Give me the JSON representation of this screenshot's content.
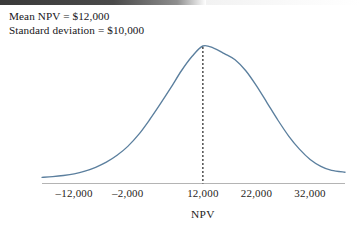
{
  "figure": {
    "background_color": "#ffffff",
    "top_bar_color": "#3a3a3a"
  },
  "annotations": {
    "line1": "Mean NPV = $12,000",
    "line2": "Standard deviation = $10,000"
  },
  "chart_data": {
    "type": "line",
    "title": "",
    "subtitle": "",
    "xlabel": "NPV",
    "ylabel": "",
    "grid": false,
    "legend": null,
    "curve_color": "#5b7f9e",
    "axis_color": "#b4b4b4",
    "mean": 12000,
    "std_dev": 10000,
    "annotations": [
      "Mean NPV = $12,000",
      "Standard deviation = $10,000"
    ],
    "mean_line": {
      "x": 12000,
      "style": "dashed",
      "color": "#222222"
    },
    "xlim": [
      -18000,
      38500
    ],
    "ylim": [
      0,
      1
    ],
    "xticks": [
      -12000,
      -2000,
      12000,
      22000,
      32000
    ],
    "xticklabels": [
      "–12,000",
      "–2,000",
      "12,000",
      "22,000",
      "32,000"
    ],
    "x": [
      -18000,
      -16000,
      -14000,
      -12000,
      -10000,
      -8000,
      -6000,
      -4000,
      -2000,
      0,
      2000,
      4000,
      6000,
      8000,
      10000,
      12000,
      14000,
      16000,
      18000,
      20000,
      22000,
      24000,
      26000,
      28000,
      30000,
      32000,
      34000,
      36000,
      38500
    ],
    "y": [
      0.045,
      0.05,
      0.058,
      0.07,
      0.09,
      0.118,
      0.155,
      0.205,
      0.27,
      0.355,
      0.46,
      0.575,
      0.695,
      0.82,
      0.925,
      1.0,
      0.985,
      0.945,
      0.9,
      0.82,
      0.71,
      0.585,
      0.46,
      0.345,
      0.25,
      0.175,
      0.125,
      0.095,
      0.082
    ]
  }
}
